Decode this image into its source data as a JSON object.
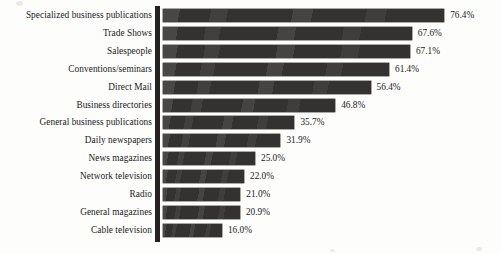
{
  "figure": {
    "axis_color": "#242320",
    "bar_color": "#333230",
    "text_color": "#1b1b1b",
    "background": "#fdfdfc"
  },
  "chart_data": {
    "type": "bar",
    "orientation": "horizontal",
    "title": "",
    "subtitle": "",
    "xlabel": "",
    "ylabel": "",
    "grid": false,
    "legend": false,
    "xlim": [
      0,
      80
    ],
    "value_suffix": "%",
    "categories": [
      "Specialized business publications",
      "Trade Shows",
      "Salespeople",
      "Conventions/seminars",
      "Direct Mail",
      "Business directories",
      "General business publications",
      "Daily newspapers",
      "News magazines",
      "Network television",
      "Radio",
      "General magazines",
      "Cable television"
    ],
    "values": [
      76.4,
      67.6,
      67.1,
      61.4,
      56.4,
      46.8,
      35.7,
      31.9,
      25.0,
      22.0,
      21.0,
      20.9,
      16.0
    ],
    "value_labels": [
      "76.4%",
      "67.6%",
      "67.1%",
      "61.4%",
      "56.4%",
      "46.8%",
      "35.7%",
      "31.9%",
      "25.0%",
      "22.0%",
      "21.0%",
      "20.9%",
      "16.0%"
    ]
  }
}
